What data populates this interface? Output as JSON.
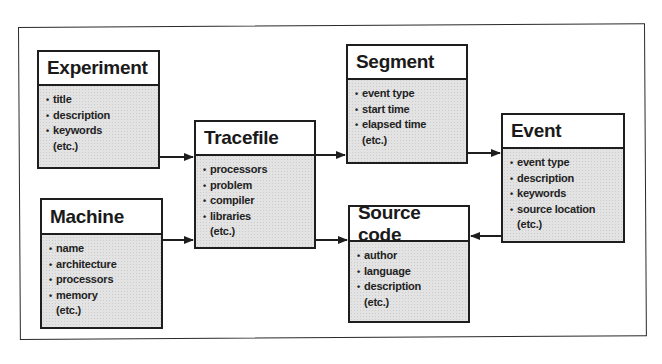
{
  "diagram": {
    "type": "entity-relationship",
    "entities": [
      {
        "id": "experiment",
        "title": "Experiment",
        "attributes": [
          "title",
          "description",
          "keywords"
        ],
        "etc": "(etc.)"
      },
      {
        "id": "machine",
        "title": "Machine",
        "attributes": [
          "name",
          "architecture",
          "processors",
          "memory"
        ],
        "etc": "(etc.)"
      },
      {
        "id": "tracefile",
        "title": "Tracefile",
        "attributes": [
          "processors",
          "problem",
          "compiler",
          "libraries"
        ],
        "etc": "(etc.)"
      },
      {
        "id": "segment",
        "title": "Segment",
        "attributes": [
          "event type",
          "start time",
          "elapsed time"
        ],
        "etc": "(etc.)"
      },
      {
        "id": "source_code",
        "title": "Source code",
        "attributes": [
          "author",
          "language",
          "description"
        ],
        "etc": "(etc.)"
      },
      {
        "id": "event",
        "title": "Event",
        "attributes": [
          "event type",
          "description",
          "keywords",
          "source location"
        ],
        "etc": "(etc.)"
      }
    ],
    "relations": [
      {
        "from": "experiment",
        "to": "tracefile"
      },
      {
        "from": "machine",
        "to": "tracefile"
      },
      {
        "from": "tracefile",
        "to": "segment"
      },
      {
        "from": "tracefile",
        "to": "source_code"
      },
      {
        "from": "segment",
        "to": "event"
      },
      {
        "from": "event",
        "to": "source_code"
      }
    ],
    "colors": {
      "line": "#1e1e1e",
      "header_bg": "#ffffff",
      "body_bg": "#e3e3e3"
    }
  }
}
